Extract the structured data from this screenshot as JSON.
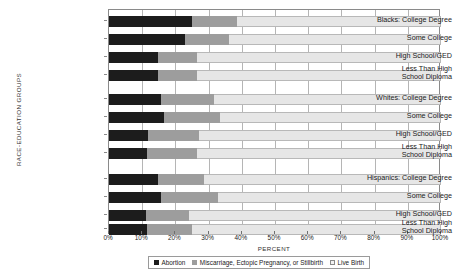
{
  "chart_data": {
    "type": "bar",
    "orientation": "horizontal",
    "stacked": true,
    "title": "",
    "xlabel": "PERCENT",
    "ylabel": "RACE-EDUCATION GROUPS",
    "xlim": [
      0,
      100
    ],
    "grid": true,
    "legend_position": "bottom",
    "xtick_labels": [
      "0%",
      "10%",
      "20%",
      "30%",
      "40%",
      "50%",
      "60%",
      "70%",
      "80%",
      "90%",
      "100%"
    ],
    "xtick_values": [
      0,
      10,
      20,
      30,
      40,
      50,
      60,
      70,
      80,
      90,
      100
    ],
    "legend": [
      {
        "label": "Abortion",
        "key": "abortion",
        "color": "#1c1c1c"
      },
      {
        "label": "Miscarriage, Ectopic Pregnancy, or Stillbirth",
        "key": "loss",
        "color": "#9d9d9d"
      },
      {
        "label": "Live Birth",
        "key": "live",
        "color": "#e6e6e6"
      }
    ],
    "series": [
      {
        "name": "Abortion",
        "values": [
          25.0,
          23.0,
          14.8,
          14.8,
          15.7,
          16.6,
          11.7,
          11.4,
          14.8,
          15.7,
          11.1,
          11.4
        ]
      },
      {
        "name": "Miscarriage, Ectopic Pregnancy, or Stillbirth",
        "values": [
          13.5,
          13.0,
          11.7,
          11.7,
          15.9,
          16.8,
          15.3,
          15.1,
          13.8,
          17.2,
          13.0,
          13.6
        ]
      },
      {
        "name": "Live Birth",
        "values": [
          61.5,
          64.0,
          73.5,
          73.5,
          68.4,
          66.6,
          73.0,
          73.5,
          71.4,
          67.1,
          75.9,
          75.0
        ]
      }
    ],
    "categories": [
      {
        "label": "Blacks:  College Degree",
        "group": "Blacks",
        "education": "College Degree"
      },
      {
        "label": "Some College",
        "group": "Blacks",
        "education": "Some College"
      },
      {
        "label": "High School/GED",
        "group": "Blacks",
        "education": "High School/GED"
      },
      {
        "label": "Less Than High\nSchool Diploma",
        "group": "Blacks",
        "education": "Less Than High School Diploma"
      },
      {
        "label": "Whites:  College Degree",
        "group": "Whites",
        "education": "College Degree"
      },
      {
        "label": "Some College",
        "group": "Whites",
        "education": "Some College"
      },
      {
        "label": "High School/GED",
        "group": "Whites",
        "education": "High School/GED"
      },
      {
        "label": "Less Than High\nSchool Diploma",
        "group": "Whites",
        "education": "Less Than High School Diploma"
      },
      {
        "label": "Hispanics:  College Degree",
        "group": "Hispanics",
        "education": "College Degree"
      },
      {
        "label": "Some College",
        "group": "Hispanics",
        "education": "Some College"
      },
      {
        "label": "High School/GED",
        "group": "Hispanics",
        "education": "High School/GED"
      },
      {
        "label": "Less Than High\nSchool Diploma",
        "group": "Hispanics",
        "education": "Less Than High School Diploma"
      }
    ],
    "row_positions": [
      15,
      33,
      51,
      69,
      93,
      111,
      129,
      147,
      173,
      191,
      209,
      223
    ]
  }
}
